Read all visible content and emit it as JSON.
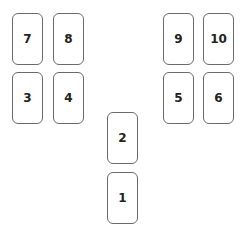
{
  "diagram": {
    "type": "card-layout",
    "cards": [
      {
        "label": "7",
        "x": 12,
        "y": 13
      },
      {
        "label": "8",
        "x": 53,
        "y": 13
      },
      {
        "label": "9",
        "x": 163,
        "y": 13
      },
      {
        "label": "10",
        "x": 203,
        "y": 13
      },
      {
        "label": "3",
        "x": 12,
        "y": 72
      },
      {
        "label": "4",
        "x": 53,
        "y": 72
      },
      {
        "label": "5",
        "x": 163,
        "y": 72
      },
      {
        "label": "6",
        "x": 203,
        "y": 72
      },
      {
        "label": "2",
        "x": 107,
        "y": 112
      },
      {
        "label": "1",
        "x": 107,
        "y": 172
      }
    ]
  }
}
